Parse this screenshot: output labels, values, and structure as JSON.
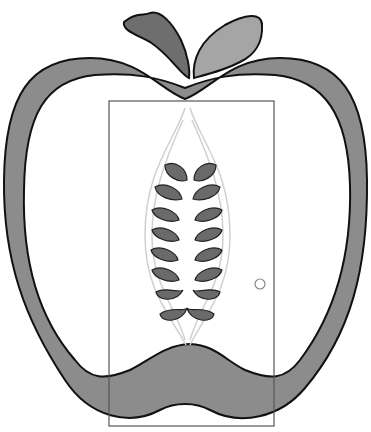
{
  "illustration": {
    "subject": "apple cross-section with door",
    "colors": {
      "background": "#ffffff",
      "apple_ring": "#8c8c8c",
      "outline": "#111111",
      "leaf_dark": "#6e6e6e",
      "leaf_light": "#a5a5a5",
      "seed": "#6a6a6a",
      "core_lines": "#d0d0d0",
      "door_frame": "#555555",
      "door_knob": "#888888"
    },
    "seed_count": 16,
    "door": {
      "x": 109,
      "y": 101,
      "width": 165,
      "height": 325
    }
  }
}
